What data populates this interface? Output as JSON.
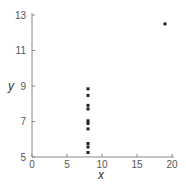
{
  "chart_data": {
    "type": "scatter",
    "title": "",
    "xlabel": "x",
    "ylabel": "y",
    "xlim": [
      0,
      20
    ],
    "ylim": [
      5,
      13
    ],
    "xticks": [
      0,
      5,
      10,
      15,
      20
    ],
    "yticks": [
      5,
      7,
      9,
      11,
      13
    ],
    "grid": false,
    "legend": null,
    "series": [
      {
        "name": "data",
        "color": "#222222",
        "x": [
          8,
          8,
          8,
          8,
          8,
          8,
          8,
          19,
          8,
          8,
          8
        ],
        "y": [
          6.58,
          5.76,
          7.71,
          8.84,
          8.47,
          7.04,
          5.25,
          12.5,
          5.56,
          7.91,
          6.89
        ]
      }
    ]
  },
  "colors": {
    "axis": "#888888",
    "point": "#222222",
    "tick_text": "#555555"
  }
}
